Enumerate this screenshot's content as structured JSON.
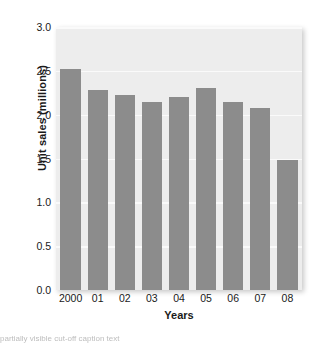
{
  "chart_data": {
    "type": "bar",
    "title": "",
    "xlabel": "Years",
    "ylabel": "Unit sales (millions)",
    "categories": [
      "2000",
      "01",
      "02",
      "03",
      "04",
      "05",
      "06",
      "07",
      "08"
    ],
    "values": [
      2.52,
      2.28,
      2.22,
      2.14,
      2.2,
      2.3,
      2.14,
      2.08,
      1.48
    ],
    "ylim": [
      0.0,
      3.0
    ],
    "yticks": [
      "0.0",
      "0.5",
      "1.0",
      "1.5",
      "2.0",
      "2.5",
      "3.0"
    ],
    "ytick_values": [
      0.0,
      0.5,
      1.0,
      1.5,
      2.0,
      2.5,
      3.0
    ],
    "grid": true,
    "legend": "none",
    "bar_color": "#8c8c8c",
    "plot_background": "#ededed",
    "gridline_color": "#fafafa",
    "text_color": "#1a1a1a"
  },
  "caption": {
    "clipped_line": "partially visible cut-off caption text"
  }
}
